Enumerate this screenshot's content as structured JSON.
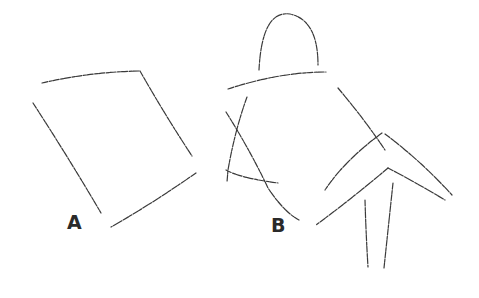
{
  "figure": {
    "type": "sketch-diagram",
    "stroke_color": "#3a3a3a",
    "background": "#ffffff",
    "labels": [
      {
        "id": "A",
        "text": "A",
        "x": 67,
        "y": 213
      },
      {
        "id": "B",
        "text": "B",
        "x": 271,
        "y": 216
      }
    ],
    "panels": [
      {
        "id": "A",
        "description": "rough quadrilateral box sketch"
      },
      {
        "id": "B",
        "description": "gestural figure sketch with head arc, shoulder line, torso and bent limbs"
      }
    ]
  }
}
